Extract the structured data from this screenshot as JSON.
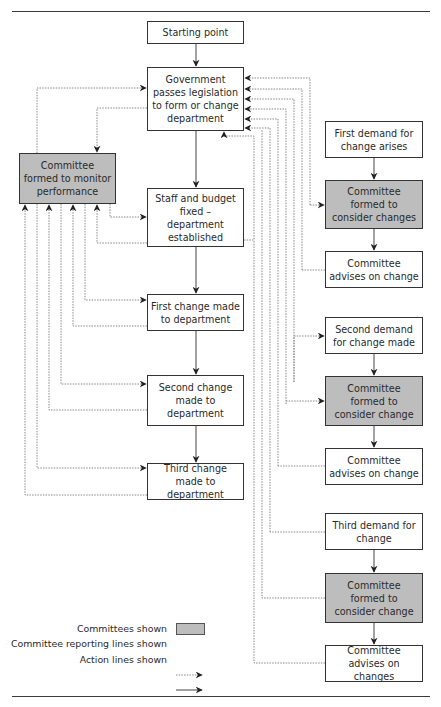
{
  "diagram": {
    "type": "flowchart",
    "colors": {
      "committee_fill": "#bdbdbd",
      "box_border": "#333333",
      "line": "#333333",
      "dotted_line": "#777777"
    },
    "left_column": [
      {
        "id": "start",
        "label": "Starting point"
      },
      {
        "id": "government",
        "label": "Government passes legislation to form or change department"
      },
      {
        "id": "staff",
        "label": "Staff and budget fixed – department established"
      },
      {
        "id": "change1",
        "label": "First change made to department"
      },
      {
        "id": "change2",
        "label": "Second change made to department"
      },
      {
        "id": "change3",
        "label": "Third change made to department"
      }
    ],
    "monitor_committee": {
      "id": "monitor",
      "label": "Committee formed to monitor performance",
      "is_committee": true
    },
    "right_column": [
      {
        "id": "demand1",
        "label": "First demand for change arises"
      },
      {
        "id": "consider1",
        "label": "Committee formed to consider changes",
        "is_committee": true
      },
      {
        "id": "advise1",
        "label": "Committee advises on change"
      },
      {
        "id": "demand2",
        "label": "Second demand for change made"
      },
      {
        "id": "consider2",
        "label": "Committee formed to consider change",
        "is_committee": true
      },
      {
        "id": "advise2",
        "label": "Committee advises on change"
      },
      {
        "id": "demand3",
        "label": "Third demand for change"
      },
      {
        "id": "consider3",
        "label": "Committee formed to consider change",
        "is_committee": true
      },
      {
        "id": "advise3",
        "label": "Committee advises on changes"
      }
    ],
    "action_edges": [
      [
        "start",
        "government"
      ],
      [
        "government",
        "staff"
      ],
      [
        "staff",
        "change1"
      ],
      [
        "change1",
        "change2"
      ],
      [
        "change2",
        "change3"
      ],
      [
        "demand1",
        "consider1"
      ],
      [
        "consider1",
        "advise1"
      ],
      [
        "demand2",
        "consider2"
      ],
      [
        "consider2",
        "advise2"
      ],
      [
        "demand3",
        "consider3"
      ],
      [
        "consider3",
        "advise3"
      ]
    ],
    "reporting_edges": [
      [
        "monitor",
        "government"
      ],
      [
        "government",
        "monitor"
      ],
      [
        "monitor",
        "staff"
      ],
      [
        "staff",
        "monitor"
      ],
      [
        "monitor",
        "change1"
      ],
      [
        "change1",
        "monitor"
      ],
      [
        "monitor",
        "change2"
      ],
      [
        "change2",
        "monitor"
      ],
      [
        "monitor",
        "change3"
      ],
      [
        "change3",
        "monitor"
      ],
      [
        "government",
        "consider1"
      ],
      [
        "advise1",
        "government"
      ],
      [
        "government",
        "demand2"
      ],
      [
        "government",
        "consider2"
      ],
      [
        "advise2",
        "government"
      ],
      [
        "advise3",
        "government"
      ],
      [
        "demand3",
        "government"
      ],
      [
        "consider3",
        "government"
      ],
      [
        "staff",
        "government"
      ]
    ]
  },
  "legend": {
    "committees": "Committees shown",
    "reporting": "Committee reporting lines shown",
    "action": "Action lines shown"
  }
}
